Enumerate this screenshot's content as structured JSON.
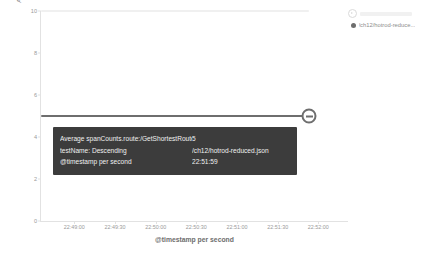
{
  "chart_data": {
    "type": "line",
    "title": "",
    "xlabel": "@timestamp per second",
    "ylabel": "Average spanCounts.route:/GetShortestRoute",
    "ylim": [
      0,
      10
    ],
    "yticks": [
      "0",
      "2",
      "4",
      "6",
      "8",
      "10"
    ],
    "ytick_values": [
      0,
      2,
      4,
      6,
      8,
      10
    ],
    "grid": false,
    "legend_position": "right",
    "x": [
      "22:49:00",
      "22:49:30",
      "22:50:00",
      "22:50:30",
      "22:51:00",
      "22:51:30",
      "22:52:00"
    ],
    "series": [
      {
        "name": "/ch12/hotrod-reduce...",
        "color": "#6e6e6e",
        "value": 5,
        "values": [
          5,
          5,
          5,
          5,
          5,
          5,
          5
        ]
      },
      {
        "name": "hidden-series",
        "color": "#e4e4e4",
        "value": 10,
        "values": [
          10,
          10,
          10,
          10,
          10,
          10,
          10
        ]
      }
    ]
  },
  "tooltip": {
    "rows": [
      {
        "key": "Average spanCounts.route:/GetShortestRoute",
        "value": "5"
      },
      {
        "key": "testName: Descending",
        "value": "/ch12/hotrod-reduced.json"
      },
      {
        "key": "@timestamp per second",
        "value": "22:51:59"
      }
    ]
  },
  "legend": {
    "collapse_icon": "chevron-right-circle-icon",
    "items": [
      {
        "label": "/ch12/hotrod-reduce...",
        "color": "#6e6e6e"
      }
    ]
  }
}
